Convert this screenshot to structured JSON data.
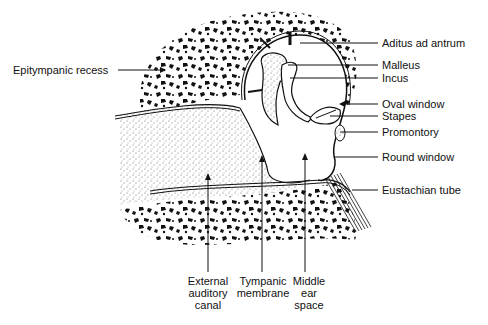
{
  "colors": {
    "ink": "#111111",
    "background": "#ffffff",
    "stipple": "#555555"
  },
  "labels": {
    "left": [
      {
        "id": "epitympanic-recess",
        "text": "Epitympanic recess"
      }
    ],
    "right": [
      {
        "id": "aditus-ad-antrum",
        "text": "Aditus ad antrum"
      },
      {
        "id": "malleus",
        "text": "Malleus"
      },
      {
        "id": "incus",
        "text": "Incus"
      },
      {
        "id": "oval-window",
        "text": "Oval window"
      },
      {
        "id": "stapes",
        "text": "Stapes"
      },
      {
        "id": "promontory",
        "text": "Promontory"
      },
      {
        "id": "round-window",
        "text": "Round window"
      },
      {
        "id": "eustachian-tube",
        "text": "Eustachian tube"
      }
    ],
    "bottom": [
      {
        "id": "external-auditory-canal",
        "lines": [
          "External",
          "auditory",
          "canal"
        ]
      },
      {
        "id": "tympanic-membrane",
        "lines": [
          "Tympanic",
          "membrane"
        ]
      },
      {
        "id": "middle-ear-space",
        "lines": [
          "Middle",
          "ear",
          "space"
        ]
      }
    ]
  }
}
